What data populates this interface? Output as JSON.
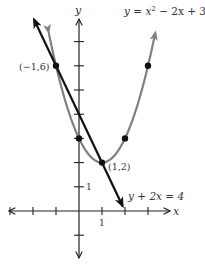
{
  "chart_data": {
    "type": "line",
    "title": "",
    "xlabel": "x",
    "ylabel": "y",
    "grid": false,
    "axis_ticks": {
      "x": [
        -3,
        -2,
        -1,
        0,
        1,
        2,
        3
      ],
      "y": [
        -1,
        1,
        2,
        3,
        4,
        5,
        6,
        7
      ],
      "labeled_x": [
        {
          "value": 1,
          "label": "1"
        }
      ],
      "labeled_y": [
        {
          "value": 1,
          "label": "1"
        }
      ]
    },
    "xlim": [
      -3.1,
      4.0
    ],
    "ylim": [
      -1.9,
      8.3
    ],
    "series": [
      {
        "name": "y = x² − 2x + 3",
        "kind": "parabola",
        "equation": "y = x^2 - 2x + 3",
        "color": "#808080",
        "x_range": [
          -1.32,
          3.32
        ],
        "points": [
          {
            "x": -1,
            "y": 6
          },
          {
            "x": 0,
            "y": 3
          },
          {
            "x": 1,
            "y": 2
          },
          {
            "x": 2,
            "y": 3
          },
          {
            "x": 3,
            "y": 6
          }
        ]
      },
      {
        "name": "y + 2x = 4",
        "kind": "line",
        "equation": "y = 4 - 2x",
        "color": "#111111",
        "x_range": [
          -1.96,
          1.9
        ],
        "points": [
          {
            "x": -1,
            "y": 6
          },
          {
            "x": 0,
            "y": 4
          },
          {
            "x": 1,
            "y": 2
          }
        ]
      }
    ],
    "annotations": [
      {
        "text": "(−1,6)",
        "x": -1,
        "y": 6
      },
      {
        "text": "(1,2)",
        "x": 1,
        "y": 2
      }
    ]
  },
  "labels": {
    "y_axis": "y",
    "x_axis": "x",
    "parabola_eq_lhs": "y = x",
    "parabola_eq_exp": "2",
    "parabola_eq_rhs": " − 2x + 3",
    "line_eq": "y + 2x = 4",
    "point_left": "(−1,6)",
    "point_vertex": "(1,2)",
    "x_tick_one": "1",
    "y_tick_one": "1"
  }
}
